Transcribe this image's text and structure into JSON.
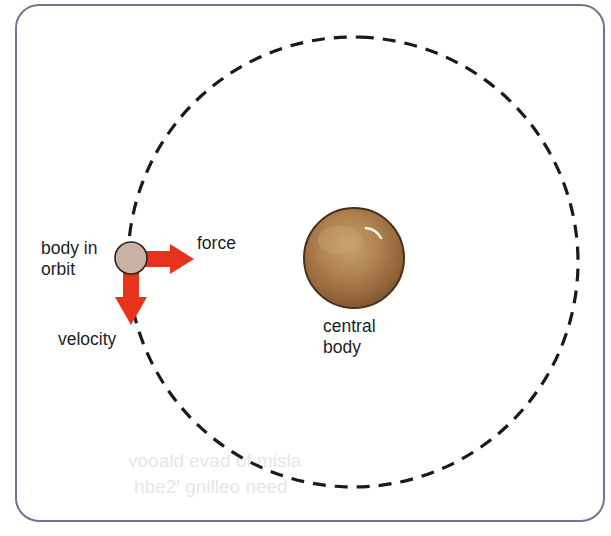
{
  "diagram": {
    "labels": {
      "orbiting_body_line1": "body in",
      "orbiting_body_line2": "orbit",
      "force": "force",
      "velocity": "velocity",
      "central_body_line1": "central",
      "central_body_line2": "body"
    },
    "colors": {
      "frame": "#7b7090",
      "orbit_path": "#1a1a1a",
      "arrows": "#e8321c",
      "orbiting_body": "#c9b2a4",
      "central_body": "#a87b45",
      "text": "#1e1e1e"
    },
    "bleed_through_text": {
      "line1": "vooald evad of misla",
      "line2": "hbe2' gnilleo need"
    }
  }
}
